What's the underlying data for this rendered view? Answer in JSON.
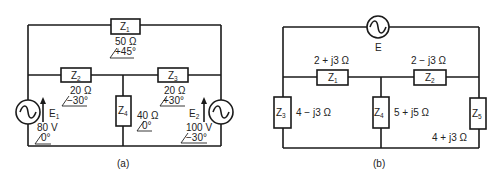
{
  "diagram_a": {
    "caption": "(a)",
    "Z1": {
      "name": "Z",
      "sub": "1",
      "magnitude": "50 Ω",
      "angle": "+45°"
    },
    "Z2": {
      "name": "Z",
      "sub": "2",
      "magnitude": "20 Ω",
      "angle": "−30°"
    },
    "Z3": {
      "name": "Z",
      "sub": "3",
      "magnitude": "20 Ω",
      "angle": "+30°"
    },
    "Z4": {
      "name": "Z",
      "sub": "4",
      "magnitude": "40 Ω",
      "angle": "0°"
    },
    "E1": {
      "name": "E",
      "sub": "1",
      "magnitude": "80 V",
      "angle": "0°"
    },
    "E2": {
      "name": "E",
      "sub": "2",
      "magnitude": "100 V",
      "angle": "−30°"
    }
  },
  "diagram_b": {
    "caption": "(b)",
    "E": {
      "name": "E"
    },
    "Z1": {
      "name": "Z",
      "sub": "1",
      "value": "2 + j3 Ω"
    },
    "Z2": {
      "name": "Z",
      "sub": "2",
      "value": "2 − j3 Ω"
    },
    "Z3": {
      "name": "Z",
      "sub": "3",
      "value": "4 − j3 Ω"
    },
    "Z4": {
      "name": "Z",
      "sub": "4",
      "value": "5 + j5 Ω"
    },
    "Z5": {
      "name": "Z",
      "sub": "5",
      "value": "4 + j3 Ω"
    }
  }
}
